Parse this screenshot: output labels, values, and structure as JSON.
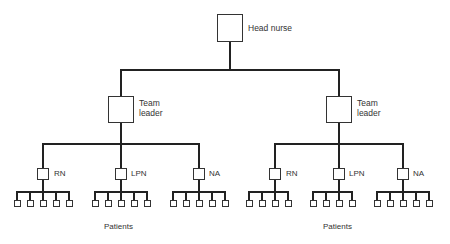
{
  "diagram": {
    "type": "organizational-chart",
    "line_color": "#222222",
    "box_color": "#333333",
    "root": {
      "label": "Head nurse"
    },
    "teams": [
      {
        "leader_label_line1": "Team",
        "leader_label_line2": "leader",
        "members": [
          {
            "label": "RN",
            "patients": 5
          },
          {
            "label": "LPN",
            "patients": 5
          },
          {
            "label": "NA",
            "patients": 5
          }
        ],
        "patients_label": "Patients"
      },
      {
        "leader_label_line1": "Team",
        "leader_label_line2": "leader",
        "members": [
          {
            "label": "RN",
            "patients": 4
          },
          {
            "label": "LPN",
            "patients": 4
          },
          {
            "label": "NA",
            "patients": 5
          }
        ],
        "patients_label": "Patients"
      }
    ]
  }
}
